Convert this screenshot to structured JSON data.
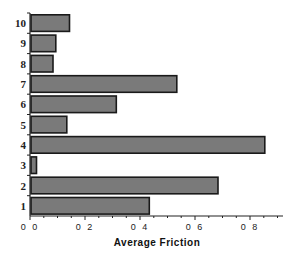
{
  "chart_data": {
    "type": "bar",
    "orientation": "horizontal",
    "title": "",
    "xlabel": "Average Friction",
    "ylabel": "",
    "categories": [
      "1",
      "2",
      "3",
      "4",
      "5",
      "6",
      "7",
      "8",
      "9",
      "10"
    ],
    "values": [
      0.43,
      0.68,
      0.02,
      0.85,
      0.13,
      0.31,
      0.53,
      0.08,
      0.09,
      0.14
    ],
    "xlim": [
      0,
      0.92
    ],
    "xticks": [
      0.0,
      0.2,
      0.4,
      0.6,
      0.8
    ],
    "xtick_labels": [
      "0 0",
      "0 2",
      "0 4",
      "0 6",
      "0 8"
    ],
    "grid": false,
    "legend": null,
    "bar_color": "#7a7a7a",
    "bar_edge_color": "#1a1a1a"
  }
}
